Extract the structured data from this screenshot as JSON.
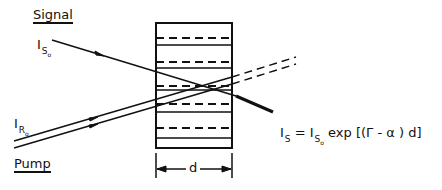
{
  "diagram": {
    "labels": {
      "signal": "Signal",
      "pump": "Pump",
      "signal_input": "I",
      "signal_input_sub": "S",
      "signal_input_subsub": "o",
      "pump_input": "I",
      "pump_input_sub": "R",
      "pump_input_subsub": "o",
      "thickness": "d"
    },
    "equation": {
      "lhs": "I",
      "lhs_sub": "S",
      "equals": " = ",
      "rhs_base": "I",
      "rhs_sub": "S",
      "rhs_subsub": "o",
      "rhs_expr": " exp [(Γ - α ) d]"
    },
    "crystal": {
      "left_x": 156,
      "right_x": 232,
      "top_y": 23,
      "bottom_y": 148,
      "solid_layers_y": [
        23,
        45,
        68,
        90,
        112,
        138,
        148
      ],
      "dashed_layers_y": [
        38,
        62,
        86,
        104,
        128
      ]
    },
    "beams": {
      "signal": {
        "from": [
          52,
          40
        ],
        "to": [
          236,
          96
        ],
        "output_to": [
          273,
          112
        ],
        "style": "solid"
      },
      "pump_upper": {
        "from": [
          14,
          138
        ],
        "to": [
          232,
          77
        ],
        "continuation_to": [
          296,
          57
        ],
        "style": "solid-then-dashed"
      },
      "pump_lower": {
        "from": [
          14,
          145
        ],
        "to": [
          232,
          84
        ],
        "continuation_to": [
          296,
          64
        ],
        "style": "solid-then-dashed"
      }
    },
    "colors": {
      "ink": "#111111",
      "background": "#ffffff"
    }
  }
}
